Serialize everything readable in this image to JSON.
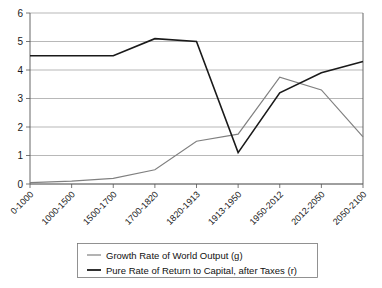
{
  "chart_data": {
    "type": "line",
    "title": "",
    "subtitle": "",
    "xlabel": "",
    "ylabel": "",
    "ylim": [
      0,
      6
    ],
    "yticks": [
      0,
      1,
      2,
      3,
      4,
      5,
      6
    ],
    "ytick_labels": [
      "0",
      "1",
      "2",
      "3",
      "4",
      "5",
      "6"
    ],
    "grid": true,
    "legend_position": "bottom",
    "categories": [
      "0-1000",
      "1000-1500",
      "1500-1700",
      "1700-1820",
      "1820-1913",
      "1913-1950",
      "1950-2012",
      "2012-2050",
      "2050-2100"
    ],
    "series": [
      {
        "name": "Growth Rate of World Output (g)",
        "color": "#808080",
        "values": [
          0.05,
          0.1,
          0.2,
          0.5,
          1.5,
          1.75,
          3.75,
          3.3,
          1.65
        ]
      },
      {
        "name": "Pure Rate of Return to Capital, after Taxes (r)",
        "color": "#1a1a1a",
        "values": [
          4.5,
          4.5,
          4.5,
          5.1,
          5.0,
          1.1,
          3.2,
          3.9,
          4.3
        ]
      }
    ]
  },
  "legend": {
    "entries": [
      {
        "label": "Growth Rate of World Output (g)",
        "color": "#808080"
      },
      {
        "label": "Pure Rate of Return to Capital, after Taxes (r)",
        "color": "#1a1a1a"
      }
    ]
  }
}
